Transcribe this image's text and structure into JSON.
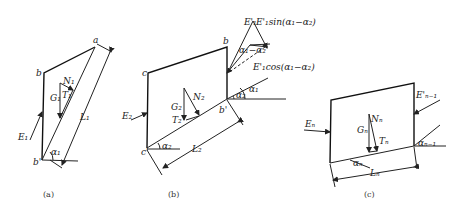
{
  "figure": {
    "panels": [
      {
        "id": "a",
        "caption": "(a)",
        "points": {
          "a": "a",
          "b": "b",
          "b_prime": "b'"
        },
        "forces": {
          "E": "E₁",
          "G": "G₁",
          "N": "N₁",
          "T": "T₁"
        },
        "length": "L₁",
        "angle": "α₁"
      },
      {
        "id": "b",
        "caption": "(b)",
        "points": {
          "b": "b",
          "c": "c",
          "b_prime": "b'",
          "c_prime": "c'"
        },
        "forces": {
          "E_left": "E₂",
          "E_right": "E'₁",
          "G": "G₂",
          "N": "N₂",
          "T": "T₂"
        },
        "components": {
          "sin": "E'₁sin(α₁−α₂)",
          "cos": "E'₁cos(α₁−α₂)",
          "diff_angle": "α₁−α₂"
        },
        "length": "L₂",
        "angles": {
          "a1": "α₁",
          "a2": "α₂",
          "a2_base": "α₂"
        }
      },
      {
        "id": "c",
        "caption": "(c)",
        "forces": {
          "E_left": "Eₙ",
          "E_right": "E'ₙ₋₁",
          "G": "Gₙ",
          "N": "Nₙ",
          "T": "Tₙ"
        },
        "length": "Lₙ",
        "angles": {
          "an": "αₙ",
          "an_prev": "αₙ₋₁"
        }
      }
    ]
  }
}
